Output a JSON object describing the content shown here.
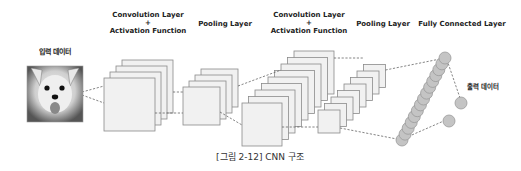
{
  "labels": {
    "input": "입력 데이터",
    "conv1_line1": "Convolution Layer",
    "conv1_plus": "+",
    "conv1_line2": "Activation Function",
    "pool1": "Pooling Layer",
    "conv2_line1": "Convolution Layer",
    "conv2_plus": "+",
    "conv2_line2": "Activation Function",
    "pool2": "Pooling Layer",
    "fc": "Fully Connected Layer",
    "output": "출력 데이터"
  },
  "caption": "[그림 2-12]  CNN 구조",
  "stages": [
    {
      "name": "input-image",
      "type": "image",
      "x": 27,
      "y": 66,
      "w": 56,
      "h": 56
    },
    {
      "name": "conv1",
      "type": "stack",
      "count": 4,
      "front": {
        "x": 104,
        "y": 78,
        "w": 51,
        "h": 53
      },
      "dx": 6,
      "dy": -6
    },
    {
      "name": "pool1",
      "type": "stack",
      "count": 4,
      "front": {
        "x": 183,
        "y": 87,
        "w": 37,
        "h": 38
      },
      "dx": 6,
      "dy": -6
    },
    {
      "name": "conv2",
      "type": "stack",
      "count": 9,
      "front": {
        "x": 242,
        "y": 103,
        "w": 40,
        "h": 43
      },
      "dx": 6.5,
      "dy": -6.5
    },
    {
      "name": "pool2",
      "type": "stack",
      "count": 8,
      "front": {
        "x": 318,
        "y": 110,
        "w": 22,
        "h": 23
      },
      "dx": 6.5,
      "dy": -6.5
    },
    {
      "name": "fc",
      "type": "nodes",
      "count": 15,
      "start": {
        "x": 402,
        "y": 140
      },
      "end": {
        "x": 445,
        "y": 58
      },
      "r": 6
    },
    {
      "name": "output",
      "type": "nodes",
      "points": [
        {
          "x": 461,
          "y": 103
        },
        {
          "x": 449,
          "y": 121
        }
      ],
      "r": 6
    }
  ],
  "colors": {
    "square_fill": "#f1f1f1",
    "square_stroke": "#8a8a8a",
    "node_fill": "#c4c4c4",
    "dash": "#666666"
  }
}
